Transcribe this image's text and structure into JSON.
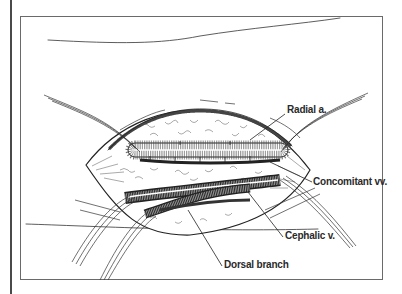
{
  "figure": {
    "type": "surgical illustration",
    "labels": {
      "radial_artery": "Radial a.",
      "concomitant_veins": "Concomitant vv.",
      "cephalic_vein": "Cephalic v.",
      "dorsal_branch": "Dorsal branch"
    },
    "colors": {
      "ink": "#2a2a2a",
      "frame": "#6a6a6a",
      "background": "#ffffff"
    }
  }
}
